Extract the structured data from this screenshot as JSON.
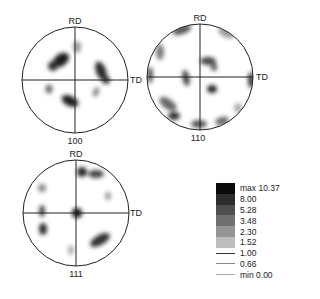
{
  "figures": [
    {
      "id": "pf100",
      "label": "100",
      "axis_top": "RD",
      "axis_right": "TD",
      "cx": 75,
      "cy": 80,
      "r": 53
    },
    {
      "id": "pf110",
      "label": "110",
      "axis_top": "RD",
      "axis_right": "TD",
      "cx": 200,
      "cy": 77,
      "r": 53
    },
    {
      "id": "pf111",
      "label": "111",
      "axis_top": "RD",
      "axis_right": "TD",
      "cx": 76,
      "cy": 213,
      "r": 53
    }
  ],
  "legend": {
    "levels": [
      {
        "label": "max 10.37",
        "kind": "fill",
        "color": "#0a0a0a"
      },
      {
        "label": "8.00",
        "kind": "fill",
        "color": "#2c2c2c"
      },
      {
        "label": "5.28",
        "kind": "fill",
        "color": "#4e4e4e"
      },
      {
        "label": "3.48",
        "kind": "fill",
        "color": "#707070"
      },
      {
        "label": "2.30",
        "kind": "fill",
        "color": "#959595"
      },
      {
        "label": "1.52",
        "kind": "fill",
        "color": "#bdbdbd"
      },
      {
        "label": "1.00",
        "kind": "line",
        "color": "#333333"
      },
      {
        "label": "0.66",
        "kind": "line",
        "color": "#888888"
      },
      {
        "label": "min 0.00",
        "kind": "line",
        "color": "#aaaaaa"
      }
    ]
  }
}
